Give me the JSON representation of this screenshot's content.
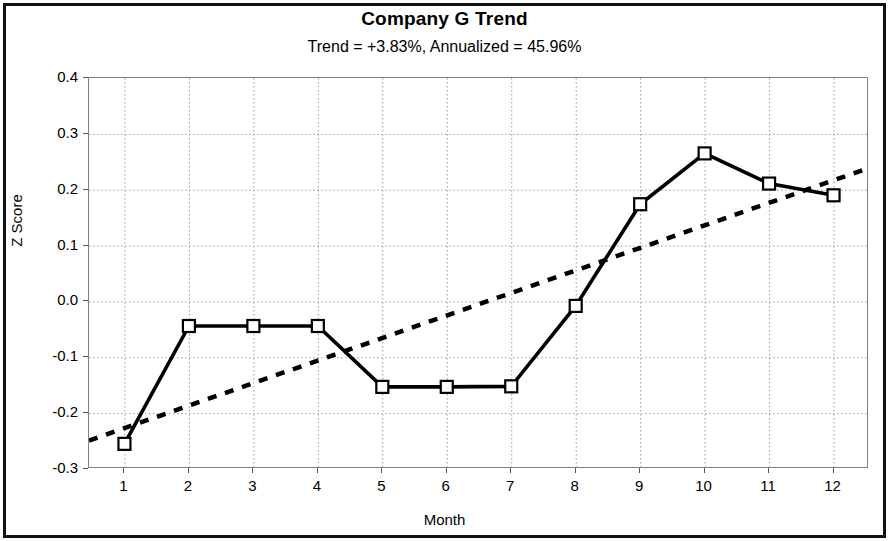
{
  "chart_data": {
    "type": "line",
    "title": "Company G Trend",
    "subtitle": "Trend = +3.83%,  Annualized = 45.96%",
    "xlabel": "Month",
    "ylabel": "Z Score",
    "x": [
      1,
      2,
      3,
      4,
      5,
      6,
      7,
      8,
      9,
      10,
      11,
      12
    ],
    "xtick_labels": [
      "1",
      "2",
      "3",
      "4",
      "5",
      "6",
      "7",
      "8",
      "9",
      "10",
      "11",
      "12"
    ],
    "ytick_labels": [
      "0.4",
      "0.3",
      "0.2",
      "0.1",
      "0.0",
      "-0.1",
      "-0.2",
      "-0.3"
    ],
    "ytick_values": [
      0.4,
      0.3,
      0.2,
      0.1,
      0.0,
      -0.1,
      -0.2,
      -0.3
    ],
    "xlim": [
      0.45,
      12.55
    ],
    "ylim": [
      -0.3,
      0.4
    ],
    "grid": "dotted gridlines on both axes",
    "legend": "none",
    "series": [
      {
        "name": "Z Score",
        "type": "line",
        "marker": "open-square",
        "color": "#000000",
        "values": [
          -0.255,
          -0.044,
          -0.044,
          -0.044,
          -0.153,
          -0.153,
          -0.152,
          -0.008,
          0.174,
          0.265,
          0.211,
          0.19
        ]
      },
      {
        "name": "Trend line",
        "type": "line",
        "style": "dashed",
        "color": "#000000",
        "endpoints": [
          {
            "x": 0.45,
            "y": -0.249
          },
          {
            "x": 12.55,
            "y": 0.239
          }
        ]
      }
    ],
    "annotations": []
  }
}
